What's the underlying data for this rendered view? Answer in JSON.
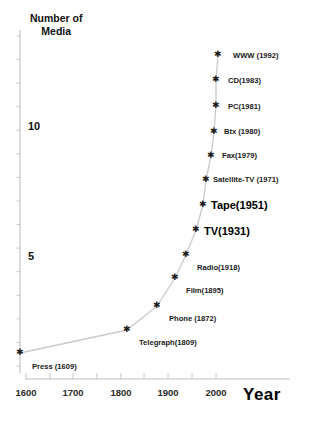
{
  "chart_data": {
    "type": "line",
    "title": "",
    "ylabel": "Number of Media",
    "xlabel": "Year",
    "xlim": [
      1570,
      2015
    ],
    "ylim": [
      0,
      14.6
    ],
    "grid": false,
    "legend": null,
    "x": [
      1609,
      1809,
      1872,
      1895,
      1918,
      1931,
      1951,
      1971,
      1979,
      1980,
      1981,
      1983,
      1992
    ],
    "values": [
      1,
      2,
      3,
      4,
      5,
      6,
      7,
      8,
      9,
      10,
      11,
      12,
      13
    ],
    "point_labels": [
      "Press (1609)",
      "Telegraph(1809)",
      "Phone (1872)",
      "Film(1895)",
      "Radio(1918)",
      "TV(1931)",
      "Tape(1951)",
      "Satellite-TV (1971)",
      "Fax(1979)",
      "Btx (1980)",
      "PC(1981)",
      "CD(1983)",
      "WWW (1992)"
    ],
    "xticks": [
      1600,
      1650,
      1700,
      1750,
      1800,
      1850,
      1900,
      1950,
      2000
    ],
    "xtick_labels": [
      "1600",
      "",
      "1700",
      "",
      "1800",
      "",
      "1900",
      "",
      "2000"
    ],
    "ytick_labels": [
      "10",
      "5"
    ],
    "ytick_values": [
      10,
      5
    ],
    "line_color": "#c8c8c8",
    "marker_color": "#1a1a1a",
    "axis_color": "#b4b4b4",
    "text_color": "#1a1a1a"
  },
  "axis": {
    "y_title_line1": "Number of",
    "y_title_line2": "Media",
    "x_title": "Year"
  },
  "points": [
    {
      "label": "Press (1609)",
      "emphasis": "normal",
      "px": 20,
      "py": 353,
      "lx": 32,
      "ly": 363
    },
    {
      "label": "Telegraph(1809)",
      "emphasis": "normal",
      "px": 127,
      "py": 330,
      "lx": 139,
      "ly": 339
    },
    {
      "label": "Phone (1872)",
      "emphasis": "normal",
      "px": 157,
      "py": 306,
      "lx": 169,
      "ly": 315
    },
    {
      "label": "Film(1895)",
      "emphasis": "normal",
      "px": 175,
      "py": 278,
      "lx": 186,
      "ly": 287
    },
    {
      "label": "Radio(1918)",
      "emphasis": "normal",
      "px": 186,
      "py": 255,
      "lx": 197,
      "ly": 264
    },
    {
      "label": "TV(1931)",
      "emphasis": "big",
      "px": 196,
      "py": 230,
      "lx": 204,
      "ly": 226
    },
    {
      "label": "Tape(1951)",
      "emphasis": "big",
      "px": 203,
      "py": 205,
      "lx": 211,
      "ly": 200
    },
    {
      "label": "Satellite-TV (1971)",
      "emphasis": "normal",
      "px": 206,
      "py": 180,
      "lx": 213,
      "ly": 176
    },
    {
      "label": "Fax(1979)",
      "emphasis": "normal",
      "px": 211,
      "py": 156,
      "lx": 222,
      "ly": 152
    },
    {
      "label": "Btx (1980)",
      "emphasis": "normal",
      "px": 214,
      "py": 132,
      "lx": 224,
      "ly": 128
    },
    {
      "label": "PC(1981)",
      "emphasis": "normal",
      "px": 216,
      "py": 106,
      "lx": 228,
      "ly": 103
    },
    {
      "label": "CD(1983)",
      "emphasis": "normal",
      "px": 216,
      "py": 80,
      "lx": 228,
      "ly": 77
    },
    {
      "label": "WWW (1992)",
      "emphasis": "normal",
      "px": 218,
      "py": 55,
      "lx": 233,
      "ly": 52
    }
  ],
  "ytick_labels": [
    {
      "text": "10",
      "x": 28,
      "y": 121
    },
    {
      "text": "5",
      "x": 28,
      "y": 251
    }
  ],
  "xtick_labels": [
    {
      "text": "1600",
      "x": 26
    },
    {
      "text": "1700",
      "x": 73
    },
    {
      "text": "1800",
      "x": 121
    },
    {
      "text": "1900",
      "x": 168
    },
    {
      "text": "2000",
      "x": 216
    }
  ]
}
